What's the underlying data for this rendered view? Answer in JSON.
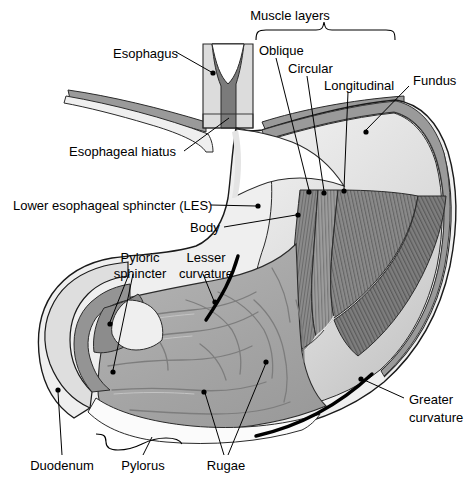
{
  "figure": {
    "type": "anatomical-diagram",
    "width": 466,
    "height": 478,
    "background": "#ffffff"
  },
  "palette": {
    "outline": "#1a1a1a",
    "serosa_light": "#e8e8e8",
    "muscularis_mid": "#b9b9b9",
    "muscularis_dark": "#8f8f8f",
    "muscle_darkest": "#6e6e6e",
    "mucosa_fill": "#a8a8a8",
    "lumen_white": "#fbfbfb",
    "diaphragm": "#9a9a9a",
    "curvature_line": "#000000",
    "label_text": "#000000"
  },
  "labels": {
    "muscle_layers": "Muscle layers",
    "esophagus": "Esophagus",
    "oblique": "Oblique",
    "circular": "Circular",
    "longitudinal": "Longitudinal",
    "fundus": "Fundus",
    "esophageal_hiatus": "Esophageal hiatus",
    "lower_esophageal_sphincter": "Lower esophageal sphincter (LES)",
    "body": "Body",
    "pyloric_sphincter_l1": "Pyloric",
    "pyloric_sphincter_l2": "sphincter",
    "lesser_curvature_l1": "Lesser",
    "lesser_curvature_l2": "curvature",
    "greater_curvature_l1": "Greater",
    "greater_curvature_l2": "curvature",
    "duodenum": "Duodenum",
    "pylorus": "Pylorus",
    "rugae": "Rugae"
  },
  "annotations": [
    {
      "id": "muscle-layers",
      "text": "Muscle layers",
      "x": 290,
      "y": 20,
      "marker": "brace",
      "brace_span": [
        256,
        395
      ],
      "brace_y": 30
    },
    {
      "id": "esophagus",
      "text": "Esophagus",
      "x": 113,
      "y": 54,
      "leader_to": [
        213,
        73
      ]
    },
    {
      "id": "oblique",
      "text": "Oblique",
      "x": 259,
      "y": 51,
      "leader_to": [
        309,
        194
      ]
    },
    {
      "id": "circular",
      "text": "Circular",
      "x": 288,
      "y": 69,
      "leader_to": [
        324,
        195
      ]
    },
    {
      "id": "longitudinal",
      "text": "Longitudinal",
      "x": 324,
      "y": 85,
      "leader_to": [
        344,
        193
      ]
    },
    {
      "id": "fundus",
      "text": "Fundus",
      "x": 413,
      "y": 80,
      "leader_to": [
        365,
        134
      ]
    },
    {
      "id": "esophageal-hiatus",
      "text": "Esophageal hiatus",
      "x": 69,
      "y": 155,
      "leader_to": [
        229,
        120
      ]
    },
    {
      "id": "lower-esophageal-sphincter",
      "text": "Lower esophageal sphincter (LES)",
      "x": 14,
      "y": 208,
      "leader_to": [
        258,
        207
      ]
    },
    {
      "id": "body",
      "text": "Body",
      "x": 190,
      "y": 231,
      "leader_to": [
        298,
        216
      ]
    },
    {
      "id": "pyloric-sphincter",
      "text": "Pyloric sphincter",
      "x": 110,
      "y": 258,
      "leader_to": [
        110,
        324
      ],
      "leader_to_2": [
        112,
        372
      ]
    },
    {
      "id": "lesser-curvature",
      "text": "Lesser curvature",
      "x": 178,
      "y": 258,
      "leader_to": [
        214,
        303
      ]
    },
    {
      "id": "greater-curvature",
      "text": "Greater curvature",
      "x": 409,
      "y": 402,
      "leader_to": [
        360,
        380
      ]
    },
    {
      "id": "duodenum",
      "text": "Duodenum",
      "x": 30,
      "y": 470,
      "leader_to": [
        58,
        390
      ]
    },
    {
      "id": "pylorus",
      "text": "Pylorus",
      "x": 120,
      "y": 470,
      "marker": "brace",
      "leader_to": [
        148,
        440
      ]
    },
    {
      "id": "rugae",
      "text": "Rugae",
      "x": 205,
      "y": 470,
      "leader_to": [
        205,
        395
      ],
      "leader_to_2": [
        265,
        365
      ]
    }
  ]
}
